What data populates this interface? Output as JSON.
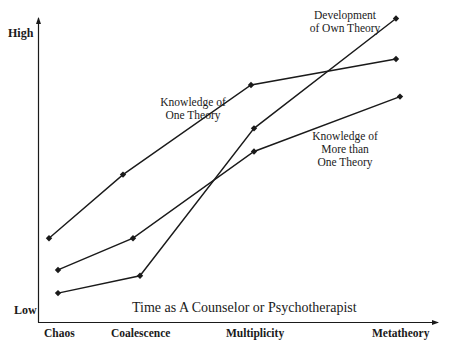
{
  "chart_data": {
    "type": "line",
    "title": "",
    "xlabel": "Time as A Counselor or Psychotherapist",
    "ylabel": "",
    "y_axis_labels": {
      "low": "Low",
      "high": "High"
    },
    "categories": [
      "Chaos",
      "Coalescence",
      "Multiplicity",
      "Metatheory"
    ],
    "ylim": [
      0,
      10.5
    ],
    "grid": false,
    "legend": "inline annotations",
    "series": [
      {
        "name": "Knowledge of One Theory",
        "values": [
          2.9,
          5.1,
          8.2,
          9.1
        ],
        "x_px": [
          49,
          123,
          251,
          396
        ]
      },
      {
        "name": "Knowledge of More than One Theory",
        "values": [
          1.8,
          2.9,
          5.9,
          7.8
        ],
        "x_px": [
          58,
          133,
          254,
          400
        ]
      },
      {
        "name": "Development of Own Theory",
        "values": [
          1.0,
          1.6,
          6.7,
          10.5
        ],
        "x_px": [
          58,
          140,
          254,
          396
        ]
      }
    ],
    "annotations": [
      {
        "text": "Knowledge of\nOne Theory",
        "series": "Knowledge of One Theory"
      },
      {
        "text": "Knowledge of\nMore than\nOne Theory",
        "series": "Knowledge of More than One Theory"
      },
      {
        "text": "Development\nof Own Theory",
        "series": "Development of Own Theory"
      }
    ],
    "line_color": "#1a1a1a",
    "marker": "diamond"
  },
  "labels": {
    "high": "High",
    "low": "Low",
    "x_title": "Time as A Counselor or Psychotherapist",
    "cat_0": "Chaos",
    "cat_1": "Coalescence",
    "cat_2": "Multiplicity",
    "cat_3": "Metatheory",
    "anno_one": "Knowledge of\nOne Theory",
    "anno_more": "Knowledge of\nMore than\nOne Theory",
    "anno_own": "Development\nof Own Theory"
  }
}
